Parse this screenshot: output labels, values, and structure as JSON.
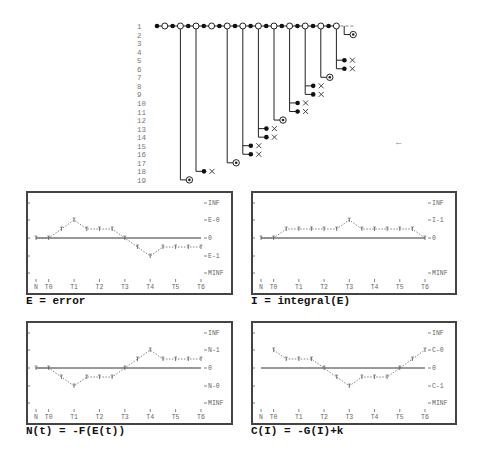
{
  "tree": {
    "row_labels": [
      "1",
      "2",
      "3",
      "4",
      "5",
      "6",
      "7",
      "8",
      "9",
      "10",
      "11",
      "12",
      "13",
      "14",
      "15",
      "16",
      "17",
      "18",
      "19"
    ],
    "trunk_nodes": [
      "filled",
      "open",
      "filled",
      "open",
      "filled",
      "open",
      "filled",
      "open",
      "filled",
      "open",
      "filled",
      "open",
      "filled",
      "open",
      "filled",
      "open",
      "filled",
      "open",
      "filled",
      "open",
      "filled",
      "open",
      "filled",
      "open"
    ],
    "trunk_continuation": "---",
    "branches": [
      {
        "from_node": 3,
        "rows": [
          {
            "row": 19,
            "type": "circle-dot"
          }
        ]
      },
      {
        "from_node": 5,
        "rows": [
          {
            "row": 18,
            "type": "dot-x"
          }
        ]
      },
      {
        "from_node": 9,
        "rows": [
          {
            "row": 17,
            "type": "circle-dot"
          }
        ]
      },
      {
        "from_node": 11,
        "rows": [
          {
            "row": 15,
            "type": "dot-x"
          },
          {
            "row": 16,
            "type": "dot-x"
          }
        ]
      },
      {
        "from_node": 13,
        "rows": [
          {
            "row": 13,
            "type": "dot-x"
          },
          {
            "row": 14,
            "type": "dot-x"
          }
        ]
      },
      {
        "from_node": 15,
        "rows": [
          {
            "row": 12,
            "type": "circle-dot"
          }
        ]
      },
      {
        "from_node": 17,
        "rows": [
          {
            "row": 10,
            "type": "dot-x"
          },
          {
            "row": 11,
            "type": "dot-x"
          }
        ]
      },
      {
        "from_node": 19,
        "rows": [
          {
            "row": 8,
            "type": "dot-x"
          },
          {
            "row": 9,
            "type": "dot-x"
          }
        ]
      },
      {
        "from_node": 21,
        "rows": [
          {
            "row": 7,
            "type": "circle-dot"
          }
        ]
      },
      {
        "from_node": 23,
        "rows": [
          {
            "row": 5,
            "type": "dot-x"
          },
          {
            "row": 6,
            "type": "dot-x"
          }
        ]
      },
      {
        "from_node": 25,
        "rows": [
          {
            "row": 2,
            "type": "circle-dot"
          }
        ]
      }
    ],
    "arrow_glyph": "←"
  },
  "chart_data": [
    {
      "type": "line",
      "title": "E = error",
      "categories": [
        "N",
        "T0",
        "",
        "T1",
        "",
        "T2",
        "",
        "T3",
        "",
        "T4",
        "",
        "T5",
        "",
        "T6"
      ],
      "x_ticks": [
        "N",
        "T0",
        "T1",
        "T2",
        "T3",
        "T4",
        "T5",
        "T6"
      ],
      "y_levels": [
        "INF",
        "E-0",
        "0",
        "E-1",
        "MINF"
      ],
      "values": [
        0,
        0,
        1,
        2,
        1,
        1,
        1,
        0,
        -1,
        -2,
        -1,
        -1,
        -1,
        -1
      ],
      "ylim": [
        -4,
        4
      ]
    },
    {
      "type": "line",
      "title": "I = integral(E)",
      "categories": [
        "N",
        "T0",
        "",
        "T1",
        "",
        "T2",
        "",
        "T3",
        "",
        "T4",
        "",
        "T5",
        "",
        "T6"
      ],
      "x_ticks": [
        "N",
        "T0",
        "T1",
        "T2",
        "T3",
        "T4",
        "T5",
        "T6"
      ],
      "y_levels": [
        "INF",
        "I-1",
        "0",
        "MINF"
      ],
      "values": [
        0,
        0,
        1,
        1,
        1,
        1,
        1,
        2,
        1,
        1,
        1,
        1,
        1,
        0
      ],
      "ylim": [
        -4,
        4
      ]
    },
    {
      "type": "line",
      "title": "N(t) = -F(E(t))",
      "categories": [
        "N",
        "T0",
        "",
        "T1",
        "",
        "T2",
        "",
        "T3",
        "",
        "T4",
        "",
        "T5",
        "",
        "T6"
      ],
      "x_ticks": [
        "N",
        "T0",
        "T1",
        "T2",
        "T3",
        "T4",
        "T5",
        "T6"
      ],
      "y_levels": [
        "INF",
        "N-1",
        "0",
        "N-0",
        "MINF"
      ],
      "values": [
        0,
        0,
        -1,
        -2,
        -1,
        -1,
        -1,
        0,
        1,
        2,
        1,
        1,
        1,
        1
      ],
      "ylim": [
        -4,
        4
      ]
    },
    {
      "type": "line",
      "title": "C(I) = -G(I)+k",
      "categories": [
        "N",
        "T0",
        "",
        "T1",
        "",
        "T2",
        "",
        "T3",
        "",
        "T4",
        "",
        "T5",
        "",
        "T6"
      ],
      "x_ticks": [
        "N",
        "T0",
        "T1",
        "T2",
        "T3",
        "T4",
        "T5",
        "T6"
      ],
      "y_levels": [
        "INF",
        "C-0",
        "0",
        "C-1",
        "MINF"
      ],
      "values": [
        null,
        2,
        1,
        1,
        1,
        0,
        -1,
        -2,
        -1,
        -1,
        -1,
        0,
        1,
        2
      ],
      "ylim": [
        -4,
        4
      ]
    }
  ],
  "captions": {
    "c1": "E = error",
    "c2": "I = integral(E)",
    "c3": "N(t) = -F(E(t))",
    "c4": "C(I) = -G(I)+k"
  }
}
